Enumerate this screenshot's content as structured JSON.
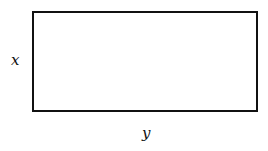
{
  "diagram": {
    "shape": "rectangle",
    "side_labels": {
      "left": "x",
      "bottom": "y"
    },
    "stroke_color": "#111111",
    "background": "#ffffff"
  }
}
